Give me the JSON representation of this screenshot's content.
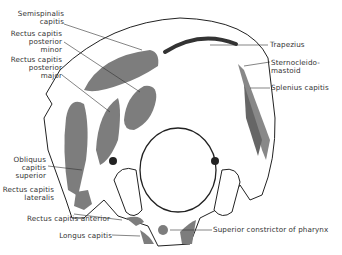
{
  "figure": {
    "colors": {
      "muscle_fill": "#7d7d7d",
      "dark_band": "#3a3a3a",
      "outline": "#222222",
      "bone": "#ffffff"
    }
  },
  "labels": {
    "left": [
      {
        "id": "semispinalis",
        "lines": [
          "Semispinalis",
          "capitis"
        ]
      },
      {
        "id": "rcp_minor",
        "lines": [
          "Rectus capitis",
          "posterior",
          "minor"
        ]
      },
      {
        "id": "rcp_major",
        "lines": [
          "Rectus capitis",
          "posterior",
          "major"
        ]
      },
      {
        "id": "obliquus",
        "lines": [
          "Obliquus",
          "capitis",
          "superior"
        ]
      },
      {
        "id": "rc_lateralis",
        "lines": [
          "Rectus capitis",
          "lateralis"
        ]
      },
      {
        "id": "rc_anterior",
        "lines": [
          "Rectus capitis anterior"
        ]
      },
      {
        "id": "longus",
        "lines": [
          "Longus capitis"
        ]
      }
    ],
    "right": [
      {
        "id": "trapezius",
        "lines": [
          "Trapezius"
        ]
      },
      {
        "id": "scm",
        "lines": [
          "Sternocleido-",
          "mastoid"
        ]
      },
      {
        "id": "splenius",
        "lines": [
          "Splenius capitis"
        ]
      },
      {
        "id": "sup_constrictor",
        "lines": [
          "Superior constrictor of pharynx"
        ]
      }
    ]
  }
}
